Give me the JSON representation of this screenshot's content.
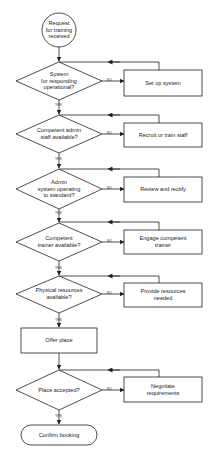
{
  "flowchart": {
    "start": {
      "label": "Request\nfor training\nreceived"
    },
    "decisions": [
      {
        "label": "System\nfor responding\noperational?",
        "no_action": "Set up system"
      },
      {
        "label": "Competent admin\nstaff available?",
        "no_action": "Recruit or train staff"
      },
      {
        "label": "Admin\nsystem operating\nto standard?",
        "no_action": "Review and rectify"
      },
      {
        "label": "Competent\ntrainer available?",
        "no_action": "Engage competent\ntrainer"
      },
      {
        "label": "Physical resources\navailable?",
        "no_action": "Provide resources\nneeded"
      }
    ],
    "process": {
      "label": "Offer place"
    },
    "final_decision": {
      "label": "Place accepted?",
      "no_action": "Negotiate\nrequirements"
    },
    "end": {
      "label": "Confirm booking"
    },
    "branch_labels": {
      "yes": "YES",
      "no": "NO"
    },
    "colors": {
      "line": "#222222",
      "background": "#ffffff"
    }
  }
}
